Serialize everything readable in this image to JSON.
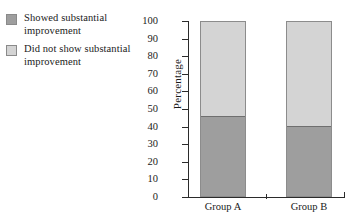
{
  "legend": {
    "entries": [
      {
        "label": "Showed substantial improvement",
        "color": "#9e9e9e",
        "swatch_name": "legend-swatch-showed-improvement"
      },
      {
        "label": "Did not show substantial improvement",
        "color": "#d4d4d4",
        "swatch_name": "legend-swatch-no-improvement"
      }
    ]
  },
  "chart_data": {
    "type": "bar",
    "title": "",
    "subtitle": "",
    "stacked": true,
    "stack_total": 100,
    "xlabel": "",
    "ylabel": "Percentage",
    "ylim": [
      0,
      100
    ],
    "yticks": [
      100,
      90,
      80,
      70,
      60,
      50,
      40,
      30,
      20,
      10,
      0
    ],
    "ytick_labels": [
      "100",
      "90",
      "80",
      "70",
      "60",
      "50",
      "40",
      "30",
      "20",
      "10",
      "0"
    ],
    "grid": false,
    "legend_position": "left-outside",
    "categories": [
      "Group A",
      "Group B"
    ],
    "series": [
      {
        "name": "Showed substantial improvement",
        "color": "#9e9e9e",
        "values": [
          46,
          40
        ]
      },
      {
        "name": "Did not show substantial improvement",
        "color": "#d4d4d4",
        "values": [
          54,
          60
        ]
      }
    ]
  }
}
